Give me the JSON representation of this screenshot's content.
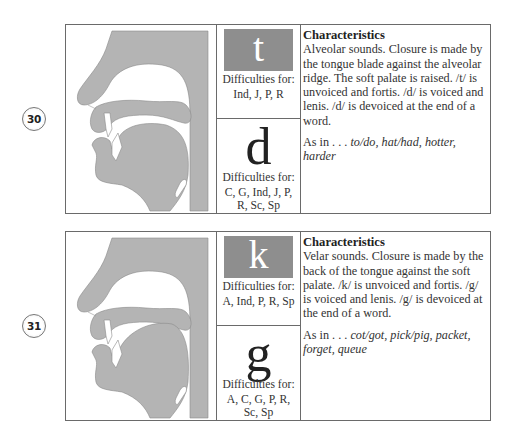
{
  "cards": [
    {
      "number": "30",
      "unvoiced": {
        "symbol": "t",
        "difficulties_label": "Difficulties for:",
        "difficulties": "Ind, J, P, R"
      },
      "voiced": {
        "symbol": "d",
        "difficulties_label": "Difficulties for:",
        "difficulties": "C, G, Ind, J, P, R, Sc, Sp"
      },
      "characteristics": {
        "heading": "Characteristics",
        "body": "Alveolar sounds. Closure is made by the tongue blade against the alveolar ridge. The soft palate is raised. /t/ is unvoiced and fortis. /d/ is voiced and lenis. /d/ is devoiced at the end of a word.",
        "examples_prefix": "As in . . .",
        "examples": "to/do, hat/had, hotter, harder"
      }
    },
    {
      "number": "31",
      "unvoiced": {
        "symbol": "k",
        "difficulties_label": "Difficulties for:",
        "difficulties": "A, Ind, P, R, Sp"
      },
      "voiced": {
        "symbol": "g",
        "difficulties_label": "Difficulties for:",
        "difficulties": "A, C, G, P, R, Sc, Sp"
      },
      "characteristics": {
        "heading": "Characteristics",
        "body": "Velar sounds. Closure is made by the back of the tongue against the soft palate. /k/ is unvoiced and fortis. /g/ is voiced and lenis. /g/ is devoiced at the end of a word.",
        "examples_prefix": "As in . . .",
        "examples": "cot/got, pick/pig, packet, forget, queue"
      }
    }
  ],
  "colors": {
    "diagram_fill": "#b4b4b4",
    "sound_box": "#8e8e8e",
    "border": "#6a6a6a"
  }
}
